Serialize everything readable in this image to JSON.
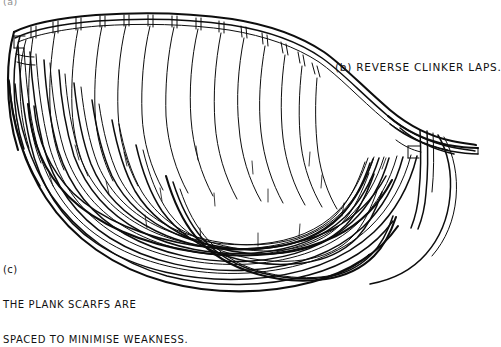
{
  "figure": {
    "kind": "technical-line-drawing",
    "background_color": "#ffffff",
    "ink_color": "#0d0d0d",
    "orientation": "bow at right, stern at left"
  },
  "labels": {
    "panel_b": "(b) REVERSE CLINKER LAPS.",
    "panel_c_tag": "(c)",
    "panel_c_line1": "THE PLANK SCARFS ARE",
    "panel_c_line2": "SPACED TO MINIMISE WEAKNESS.",
    "cropped_top_fragment": "(a)"
  },
  "parts": {
    "sheer_strake": "sheer-strake",
    "gunwale": "gunwale",
    "frames": "frame-heads",
    "planking": "lapstrake-planking",
    "scarf_joints": "plank-scarf-joints",
    "breasthook": "breasthook",
    "stem": "stem-post",
    "keel": "keel"
  },
  "counts": {
    "strakes": 9,
    "frame_heads": 13,
    "scarf_marks": 14
  }
}
